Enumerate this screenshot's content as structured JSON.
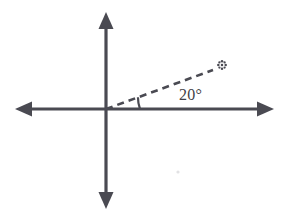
{
  "figure": {
    "background_color": "#ffffff",
    "ink_color": "#4a4a52",
    "width": 290,
    "height": 218
  },
  "axes": {
    "origin": {
      "x": 106,
      "y": 109
    },
    "horizontal": {
      "name": "x-axis",
      "left_tip": {
        "x": 15,
        "y": 109
      },
      "right_tip": {
        "x": 274,
        "y": 109
      },
      "stroke_width": 3.2,
      "double_headed": true
    },
    "vertical": {
      "name": "y-axis",
      "top_tip": {
        "x": 106,
        "y": 12
      },
      "bottom_tip": {
        "x": 106,
        "y": 209
      },
      "stroke_width": 3.2,
      "double_headed": true
    }
  },
  "ray": {
    "name": "terminal-ray",
    "style": "dashed",
    "start": {
      "x": 106,
      "y": 109
    },
    "end": {
      "x": 213,
      "y": 70
    },
    "angle_degrees": 20,
    "stroke_width": 2.6,
    "dash_pattern": "7 5",
    "endpoint_marker": {
      "name": "star-marker",
      "glyph": "✻",
      "x": 222,
      "y": 65
    }
  },
  "angle_arc": {
    "name": "angle-arc-mark",
    "vertex": {
      "x": 106,
      "y": 109
    },
    "radius": 34,
    "start_angle_degrees": 0,
    "end_angle_degrees": 20,
    "stroke_width": 2.2
  },
  "labels": {
    "angle": {
      "text": "20°",
      "x": 179,
      "y": 87,
      "font_size": 16,
      "color": "#3f3f46"
    }
  },
  "artifacts": [
    {
      "name": "scan-speck",
      "x": 178,
      "y": 172,
      "radius": 1.6,
      "color": "#e2e2e4"
    }
  ]
}
